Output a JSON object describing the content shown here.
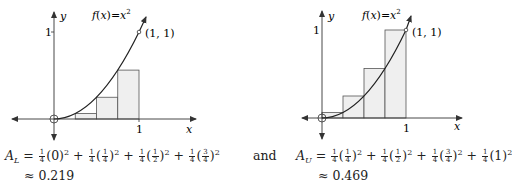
{
  "graphs": [
    {
      "id": "left",
      "title": "f(x) = x^2",
      "point_label": "(1, 1)",
      "x_axis_label": "x",
      "y_axis_label": "y",
      "x_tick": "1",
      "y_tick": "1",
      "rectangles": "left endpoints",
      "area_formula": "A_L = 1/4(0)^2 + 1/4(1/4)^2 + 1/4(1/2)^2 + 1/4(3/4)^2",
      "area_label": "A",
      "area_sub": "L",
      "terms": [
        {
          "coef_num": "1",
          "coef_den": "4",
          "arg": "0"
        },
        {
          "coef_num": "1",
          "coef_den": "4",
          "arg_num": "1",
          "arg_den": "4"
        },
        {
          "coef_num": "1",
          "coef_den": "4",
          "arg_num": "1",
          "arg_den": "2"
        },
        {
          "coef_num": "1",
          "coef_den": "4",
          "arg_num": "3",
          "arg_den": "4"
        }
      ],
      "approx": "≈ 0.219"
    },
    {
      "id": "right",
      "title": "f(x) = x^2",
      "point_label": "(1, 1)",
      "x_axis_label": "x",
      "y_axis_label": "y",
      "x_tick": "1",
      "y_tick": "1",
      "rectangles": "right endpoints",
      "area_formula": "A_U = 1/4(1/4)^2 + 1/4(1/2)^2 + 1/4(3/4)^2 + 1/4(1)^2",
      "area_label": "A",
      "area_sub": "U",
      "terms": [
        {
          "coef_num": "1",
          "coef_den": "4",
          "arg_num": "1",
          "arg_den": "4"
        },
        {
          "coef_num": "1",
          "coef_den": "4",
          "arg_num": "1",
          "arg_den": "2"
        },
        {
          "coef_num": "1",
          "coef_den": "4",
          "arg_num": "3",
          "arg_den": "4"
        },
        {
          "coef_num": "1",
          "coef_den": "4",
          "arg": "1"
        }
      ],
      "approx": "≈ 0.469"
    }
  ],
  "connector": "and",
  "labels": {
    "f": "f",
    "x": "x",
    "eq": "=",
    "sq": "2",
    "one_one": "(1, 1)",
    "one": "1"
  },
  "colors": {
    "rect_fill": "#efefef",
    "line": "#333333"
  }
}
